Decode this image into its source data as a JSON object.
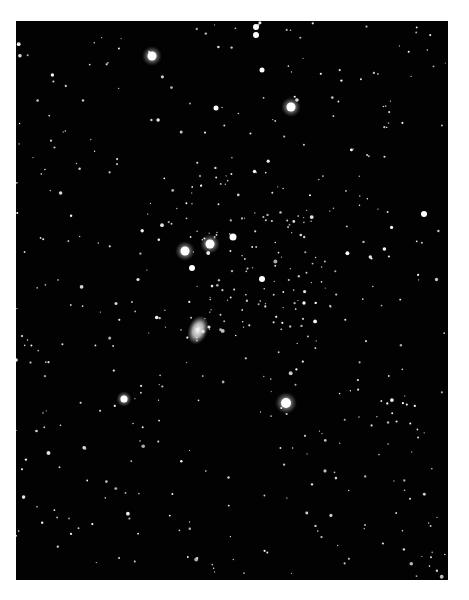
{
  "image": {
    "subject": "Star field photograph (Orion constellation)",
    "frame": {
      "x": 16,
      "y": 21,
      "w": 432,
      "h": 559,
      "background": "#020202",
      "page_background": "#ffffff"
    },
    "bright_stars": [
      {
        "x": 152,
        "y": 56,
        "r": 4.5,
        "halo": true
      },
      {
        "x": 256,
        "y": 27,
        "r": 3,
        "halo": false
      },
      {
        "x": 256,
        "y": 35,
        "r": 3,
        "halo": false
      },
      {
        "x": 291,
        "y": 107,
        "r": 4.5,
        "halo": true
      },
      {
        "x": 185,
        "y": 251,
        "r": 4.5,
        "halo": true
      },
      {
        "x": 210,
        "y": 244,
        "r": 4.5,
        "halo": true
      },
      {
        "x": 233,
        "y": 237,
        "r": 3.5,
        "halo": false
      },
      {
        "x": 192,
        "y": 268,
        "r": 3,
        "halo": false
      },
      {
        "x": 262,
        "y": 279,
        "r": 3,
        "halo": false
      },
      {
        "x": 124,
        "y": 399,
        "r": 3.5,
        "halo": true
      },
      {
        "x": 286,
        "y": 403,
        "r": 5,
        "halo": true
      },
      {
        "x": 424,
        "y": 214,
        "r": 3,
        "halo": false
      },
      {
        "x": 216,
        "y": 108,
        "r": 2.5,
        "halo": false
      },
      {
        "x": 262,
        "y": 70,
        "r": 2.5,
        "halo": false
      }
    ],
    "nebula": {
      "x": 198,
      "y": 330,
      "rx": 10,
      "ry": 15
    },
    "star_seed": 7,
    "faint_star_count": 520
  }
}
